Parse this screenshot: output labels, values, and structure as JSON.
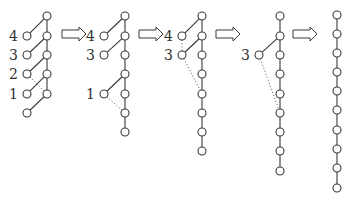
{
  "diagram": {
    "style": {
      "stroke_color": "#3a3a3a",
      "node_fill": "#ffffff",
      "background": "#ffffff"
    },
    "arrows": [
      {
        "x": 62,
        "y": 34,
        "w": 24
      },
      {
        "x": 139,
        "y": 34,
        "w": 24
      },
      {
        "x": 216,
        "y": 34,
        "w": 24
      },
      {
        "x": 293,
        "y": 34,
        "w": 24
      }
    ],
    "stages": [
      {
        "spine_x": 47,
        "spine_y": [
          16,
          36,
          55,
          74,
          94
        ],
        "side_x": 27,
        "side_nodes": [
          {
            "label": "4",
            "y": 36,
            "attach_y": 16
          },
          {
            "label": "3",
            "y": 55,
            "attach_y": 36
          },
          {
            "label": "2",
            "y": 74,
            "attach_y": 55,
            "dotted_to_y": 94
          },
          {
            "label": "1",
            "y": 94,
            "attach_y": 74
          },
          {
            "label": "",
            "y": 113,
            "attach_y": 94
          }
        ]
      },
      {
        "spine_x": 125,
        "spine_y": [
          16,
          36,
          55,
          74,
          94,
          113,
          132
        ],
        "side_x": 104,
        "side_nodes": [
          {
            "label": "4",
            "y": 36,
            "attach_y": 16
          },
          {
            "label": "3",
            "y": 55,
            "attach_y": 36
          },
          {
            "label": "1",
            "y": 94,
            "attach_y": 74,
            "dotted_to_y": 113
          }
        ]
      },
      {
        "spine_x": 202,
        "spine_y": [
          16,
          36,
          55,
          74,
          94,
          113,
          132,
          151
        ],
        "side_x": 182,
        "side_nodes": [
          {
            "label": "4",
            "y": 36,
            "attach_y": 16,
            "dotted_to_side_y": 55
          },
          {
            "label": "3",
            "y": 55,
            "attach_y": 36,
            "dotted_to_y": 94
          }
        ]
      },
      {
        "spine_x": 280,
        "spine_y": [
          16,
          36,
          55,
          74,
          94,
          113,
          132,
          151,
          171
        ],
        "side_x": 259,
        "side_nodes": [
          {
            "label": "3",
            "y": 55,
            "attach_y": 36,
            "dotted_to_y": 113
          }
        ]
      },
      {
        "spine_x": 337,
        "spine_y": [
          15,
          34,
          53,
          72,
          91,
          110,
          130,
          149,
          168,
          188
        ],
        "side_x": 0,
        "side_nodes": []
      }
    ]
  }
}
